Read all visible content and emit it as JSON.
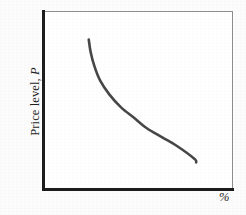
{
  "figure": {
    "kind": "economics-diagram",
    "background_color": "#fcfcfc",
    "plot_background_color": "#ffffff"
  },
  "axes": {
    "y_label_text": "Price level,",
    "y_label_variable": "P",
    "x_label_text": "%",
    "axis_color": "#1c1c1c",
    "frame_color": "#8f8f8f"
  },
  "chart_data": {
    "type": "line",
    "title": "",
    "subtitle": "",
    "xlabel": "%",
    "ylabel": "Price level, P",
    "grid": false,
    "legend": null,
    "legend_position": "none",
    "xlim": [
      0,
      100
    ],
    "ylim": [
      0,
      100
    ],
    "x_tick_labels": [],
    "y_tick_labels": [],
    "annotations": [],
    "series": [
      {
        "name": "Aggregate demand curve",
        "color": "#474747",
        "line_width": 2.6,
        "shape": "downward-sloping convex",
        "x": [
          24,
          25,
          27,
          30,
          35,
          41,
          48,
          55,
          63,
          71,
          80,
          81
        ],
        "y": [
          84,
          77,
          69,
          61,
          53,
          46,
          40,
          34,
          29,
          24,
          17,
          15
        ]
      }
    ]
  }
}
